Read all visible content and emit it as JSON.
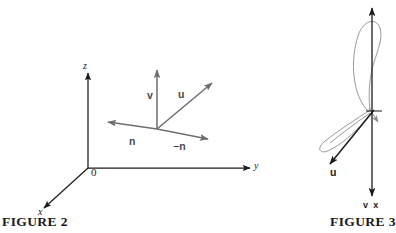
{
  "page": {
    "background_color": "#ffffff",
    "width": 391,
    "height": 233
  },
  "figure2": {
    "caption": "FIGURE 2",
    "axes_color": "#1b1b1b",
    "vector_color": "#6e6e6e",
    "axis_labels": {
      "z": "z",
      "y": "y",
      "x": "x",
      "origin": "0"
    },
    "vectors": [
      {
        "name": "v",
        "label": "v",
        "direction": "up"
      },
      {
        "name": "u",
        "label": "u",
        "direction": "up-right"
      },
      {
        "name": "n",
        "label": "n",
        "direction": "left"
      },
      {
        "name": "minus-n",
        "label": "−n",
        "direction": "right"
      }
    ]
  },
  "figure3": {
    "caption": "FIGURE 3",
    "axis_color": "#1b1b1b",
    "curve_color": "#8d8d8d",
    "labels": {
      "u": "u",
      "cross": "v x"
    }
  }
}
